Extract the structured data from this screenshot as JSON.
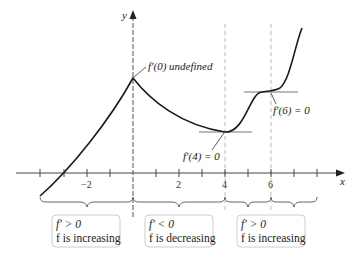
{
  "axes": {
    "x_label": "x",
    "y_label": "y",
    "tick_labels": [
      {
        "value": -2,
        "text": "−2"
      },
      {
        "value": 2,
        "text": "2"
      },
      {
        "value": 4,
        "text": "4"
      },
      {
        "value": 6,
        "text": "6"
      }
    ]
  },
  "annotations": {
    "peak": "f′(0) undefined",
    "min": "f′(4) = 0",
    "inflection": "f′(6) = 0"
  },
  "intervals": [
    {
      "line1": "f′ > 0",
      "line2": "f is increasing"
    },
    {
      "line1": "f′ < 0",
      "line2": "f is decreasing"
    },
    {
      "line1": "f′ > 0",
      "line2": "f is increasing"
    }
  ],
  "colors": {
    "curve": "#1a1a1a",
    "axis": "#333333",
    "dashed": "#aaaaaa",
    "box_border": "#cccccc"
  }
}
